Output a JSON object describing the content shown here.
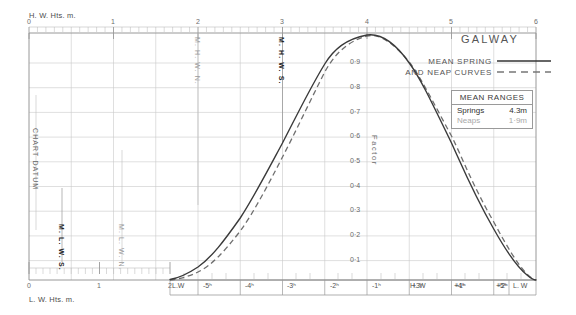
{
  "title": "GALWAY",
  "legend": {
    "line1": "MEAN SPRING",
    "line2": "AND NEAP CURVES",
    "spring_style": "solid",
    "neap_style": "dashed",
    "spring_color": "#333333",
    "neap_color": "#777777"
  },
  "mean_ranges": {
    "heading": "MEAN RANGES",
    "springs_label": "Springs",
    "springs_value": "4.3m",
    "neaps_label": "Neaps",
    "neaps_value": "1·9m"
  },
  "axes": {
    "top_caption": "H. W. Hts. m.",
    "bottom_caption": "L. W. Hts. m.",
    "factor_label": "Factor",
    "top_ticks": [
      "0",
      "1",
      "2",
      "3",
      "4",
      "5",
      "6"
    ],
    "bottom_ticks": [
      "0",
      "1",
      "2"
    ],
    "factor_ticks": [
      "0·9",
      "0·8",
      "0·7",
      "0·6",
      "0·5",
      "0·4",
      "0·3",
      "0·2",
      "0·1"
    ],
    "time_ticks": [
      "L.W",
      "-5ʰ",
      "-4ʰ",
      "-3ʰ",
      "-2ʰ",
      "-1ʰ",
      "H. W",
      "+1ʰ",
      "+2ʰ",
      "+3ʰ",
      "+4ʰ",
      "+5ʰ",
      "L. W"
    ]
  },
  "datum_markers": [
    {
      "name": "chart-datum",
      "text": "CHART DATUM",
      "emphasis": "normal"
    },
    {
      "name": "mlws",
      "text": "M. L. W. S.",
      "emphasis": "strong"
    },
    {
      "name": "mlwn",
      "text": "M. L. W. N.",
      "emphasis": "faint"
    },
    {
      "name": "mhwn",
      "text": "M. H. W. N.",
      "emphasis": "faint"
    },
    {
      "name": "mhws",
      "text": "M. H. W. S.",
      "emphasis": "strong"
    }
  ],
  "chart_data": {
    "type": "line",
    "title": "GALWAY",
    "xlabel": "Hours relative to High Water",
    "ylabel": "Factor",
    "xlim": [
      -6,
      6
    ],
    "ylim": [
      0,
      1
    ],
    "grid": true,
    "legend_position": "top-right",
    "x": [
      -6,
      -5.5,
      -5,
      -4.5,
      -4,
      -3.5,
      -3,
      -2.5,
      -2,
      -1.5,
      -1,
      -0.5,
      0,
      0.5,
      1,
      1.5,
      2,
      2.5,
      3,
      3.5,
      4,
      4.5,
      5,
      5.5,
      6
    ],
    "series": [
      {
        "name": "MEAN SPRING",
        "style": "solid",
        "values": [
          0.0,
          0.01,
          0.04,
          0.08,
          0.14,
          0.22,
          0.32,
          0.43,
          0.55,
          0.68,
          0.8,
          0.92,
          1.0,
          0.96,
          0.89,
          0.79,
          0.68,
          0.57,
          0.47,
          0.37,
          0.27,
          0.18,
          0.1,
          0.04,
          0.0
        ]
      },
      {
        "name": "MEAN NEAP",
        "style": "dashed",
        "values": [
          0.0,
          0.005,
          0.025,
          0.06,
          0.11,
          0.18,
          0.27,
          0.38,
          0.5,
          0.63,
          0.76,
          0.9,
          0.99,
          0.96,
          0.9,
          0.81,
          0.71,
          0.6,
          0.49,
          0.4,
          0.31,
          0.22,
          0.14,
          0.07,
          0.015
        ]
      }
    ],
    "axis_top": {
      "label": "H. W. Hts. m.",
      "ticks": [
        0,
        1,
        2,
        3,
        4,
        5,
        6
      ]
    },
    "axis_bottom_left": {
      "label": "L. W. Hts. m.",
      "ticks": [
        0,
        1,
        2
      ]
    },
    "annotations": [
      {
        "text": "M. H. W. N.",
        "axis": "top",
        "value": 4.05
      },
      {
        "text": "M. H. W. S.",
        "axis": "top",
        "value": 5.0
      },
      {
        "text": "M. L. W. N.",
        "axis": "bottom",
        "value": 1.55
      },
      {
        "text": "M. L. W. S.",
        "axis": "bottom",
        "value": 0.65
      },
      {
        "text": "CHART DATUM",
        "axis": "bottom",
        "value": 0.1
      }
    ]
  }
}
